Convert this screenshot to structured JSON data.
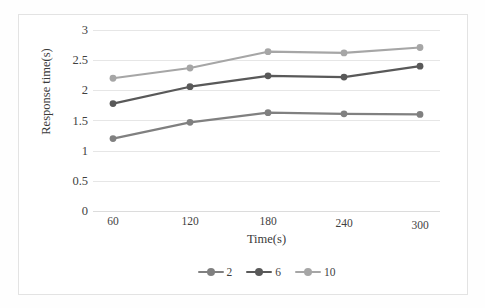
{
  "chart_data": {
    "type": "line",
    "title": "",
    "xlabel": "Time(s)",
    "ylabel": "Response time(s)",
    "categories": [
      "60",
      "120",
      "180",
      "240",
      "300"
    ],
    "x": [
      60,
      120,
      180,
      240,
      300
    ],
    "ylim": [
      0,
      3
    ],
    "xlim": [
      60,
      300
    ],
    "yticks": [
      "0",
      "0.5",
      "1",
      "1.5",
      "2",
      "2.5",
      "3"
    ],
    "ytick_values": [
      0,
      0.5,
      1,
      1.5,
      2,
      2.5,
      3
    ],
    "grid": "horizontal",
    "legend_position": "bottom-center",
    "series": [
      {
        "name": "2",
        "color": "#808080",
        "values": [
          1.2,
          1.47,
          1.63,
          1.61,
          1.6
        ]
      },
      {
        "name": "6",
        "color": "#595959",
        "values": [
          1.78,
          2.06,
          2.24,
          2.22,
          2.4
        ]
      },
      {
        "name": "10",
        "color": "#a6a6a6",
        "values": [
          2.2,
          2.37,
          2.64,
          2.62,
          2.71
        ]
      }
    ]
  },
  "axes": {
    "y_title": "Response time(s)",
    "x_title": "Time(s)",
    "ytick_0": "0",
    "ytick_1": "0.5",
    "ytick_2": "1",
    "ytick_3": "1.5",
    "ytick_4": "2",
    "ytick_5": "2.5",
    "ytick_6": "3",
    "xtick_0": "60",
    "xtick_1": "120",
    "xtick_2": "180",
    "xtick_3": "240",
    "xtick_4": "300"
  },
  "legend": {
    "items": [
      {
        "label": "2",
        "color": "#808080"
      },
      {
        "label": "6",
        "color": "#595959"
      },
      {
        "label": "10",
        "color": "#a6a6a6"
      }
    ]
  },
  "colors": {
    "gridline": "#e6e6e6",
    "frame": "#e3e3e3",
    "text": "#3a3a3a",
    "background": "#ffffff"
  }
}
